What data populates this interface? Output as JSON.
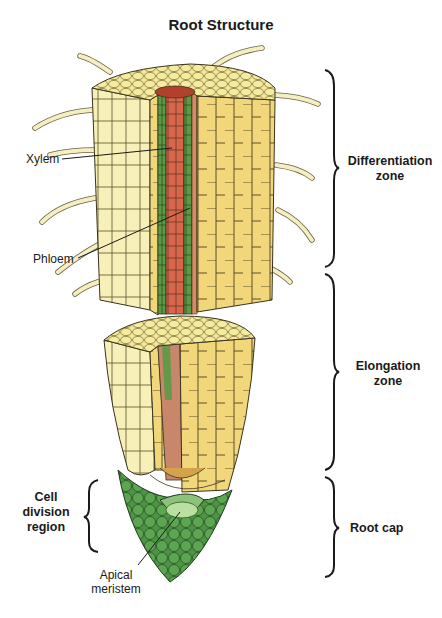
{
  "title": "Root Structure",
  "labels": {
    "xylem": "Xylem",
    "phloem": "Phloem",
    "apical_meristem_line1": "Apical",
    "apical_meristem_line2": "meristem"
  },
  "zones": {
    "differentiation_line1": "Differentiation",
    "differentiation_line2": "zone",
    "elongation_line1": "Elongation",
    "elongation_line2": "zone",
    "root_cap": "Root cap",
    "cell_division_line1": "Cell",
    "cell_division_line2": "division",
    "cell_division_line3": "region"
  },
  "colors": {
    "cortex_yellow": "#f2d77a",
    "epidermis_pale": "#f7f0b8",
    "xylem_red": "#d9654a",
    "phloem_green": "#5a9a45",
    "cap_green": "#4e9446",
    "meristem_light": "#a8d690",
    "outline": "#3a3320"
  }
}
